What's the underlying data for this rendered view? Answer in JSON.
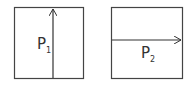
{
  "panels": [
    {
      "label": "P",
      "subscript": "1",
      "arrow_direction": "up"
    },
    {
      "label": "P",
      "subscript": "2",
      "arrow_direction": "right"
    }
  ],
  "colors": {
    "stroke": "#444444",
    "background": "#ffffff"
  }
}
